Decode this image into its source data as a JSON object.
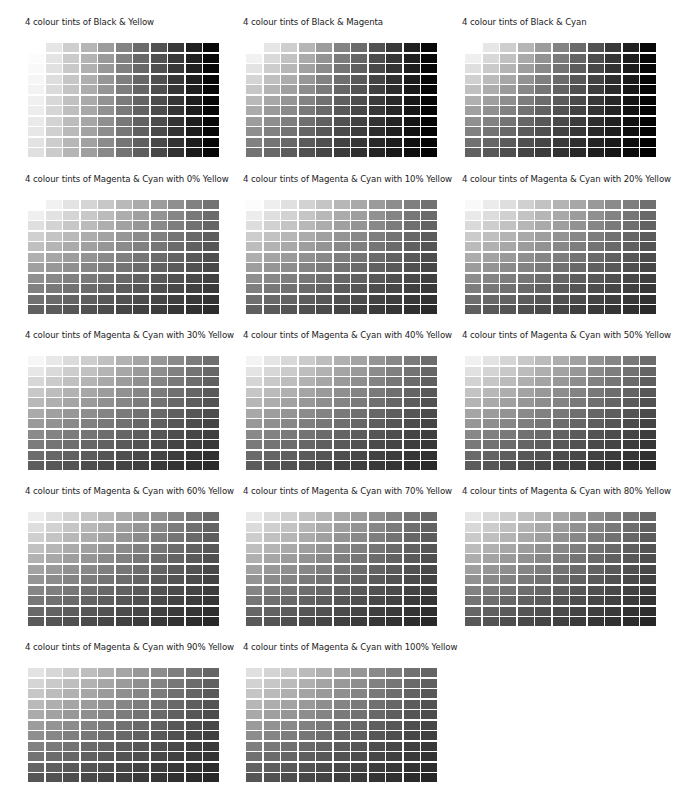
{
  "panels": [
    {
      "title": "4 colour tints of Black & Yellow",
      "x": 25,
      "y": 17,
      "col_ink": "Black",
      "row_ink": "Yellow",
      "row_factors": "y"
    },
    {
      "title": "4 colour tints of Black & Magenta",
      "x": 243,
      "y": 17,
      "col_ink": "Black",
      "row_ink": "Magenta",
      "row_factors": "m"
    },
    {
      "title": "4 colour tints of Black & Cyan",
      "x": 462,
      "y": 17,
      "col_ink": "Black",
      "row_ink": "Cyan",
      "row_factors": "c"
    },
    {
      "title": "4 colour tints of Magenta & Cyan with 0% Yellow",
      "x": 25,
      "y": 174,
      "col_ink": "Magenta",
      "row_ink": "Cyan",
      "yellow": 0
    },
    {
      "title": "4 colour tints of Magenta & Cyan with 10% Yellow",
      "x": 243,
      "y": 174,
      "col_ink": "Magenta",
      "row_ink": "Cyan",
      "yellow": 10
    },
    {
      "title": "4 colour tints of Magenta & Cyan with 20% Yellow",
      "x": 462,
      "y": 174,
      "col_ink": "Magenta",
      "row_ink": "Cyan",
      "yellow": 20
    },
    {
      "title": "4 colour tints of Magenta & Cyan with 30% Yellow",
      "x": 25,
      "y": 330,
      "col_ink": "Magenta",
      "row_ink": "Cyan",
      "yellow": 30
    },
    {
      "title": "4 colour tints of Magenta & Cyan with 40% Yellow",
      "x": 243,
      "y": 330,
      "col_ink": "Magenta",
      "row_ink": "Cyan",
      "yellow": 40
    },
    {
      "title": "4 colour tints of Magenta & Cyan with 50% Yellow",
      "x": 462,
      "y": 330,
      "col_ink": "Magenta",
      "row_ink": "Cyan",
      "yellow": 50
    },
    {
      "title": "4 colour tints of Magenta & Cyan with 60% Yellow",
      "x": 25,
      "y": 486,
      "col_ink": "Magenta",
      "row_ink": "Cyan",
      "yellow": 60
    },
    {
      "title": "4 colour tints of Magenta & Cyan with 70% Yellow",
      "x": 243,
      "y": 486,
      "col_ink": "Magenta",
      "row_ink": "Cyan",
      "yellow": 70
    },
    {
      "title": "4 colour tints of Magenta & Cyan with 80% Yellow",
      "x": 462,
      "y": 486,
      "col_ink": "Magenta",
      "row_ink": "Cyan",
      "yellow": 80
    },
    {
      "title": "4 colour tints of Magenta & Cyan with 90% Yellow",
      "x": 25,
      "y": 642,
      "col_ink": "Magenta",
      "row_ink": "Cyan",
      "yellow": 90
    },
    {
      "title": "4 colour tints of Magenta & Cyan with 100% Yellow",
      "x": 243,
      "y": 642,
      "col_ink": "Magenta",
      "row_ink": "Cyan",
      "yellow": 100
    }
  ],
  "chart_data": {
    "type": "heatmap",
    "grid": {
      "columns": 11,
      "rows": 11
    },
    "tint_steps_percent": [
      0,
      10,
      20,
      30,
      40,
      50,
      60,
      70,
      80,
      90,
      100
    ],
    "value_formula": "gray(0-255) = 255 * col_factor[col] * row_factor[row] * yellow_factor(panel)",
    "factors": {
      "k": [
        1.0,
        0.903,
        0.806,
        0.709,
        0.612,
        0.515,
        0.418,
        0.321,
        0.224,
        0.127,
        0.03
      ],
      "y": [
        1.0,
        0.988,
        0.976,
        0.964,
        0.952,
        0.94,
        0.928,
        0.916,
        0.904,
        0.892,
        0.88
      ],
      "m": [
        1.0,
        0.945,
        0.89,
        0.835,
        0.78,
        0.725,
        0.67,
        0.615,
        0.56,
        0.505,
        0.45
      ],
      "c": [
        1.0,
        0.938,
        0.876,
        0.814,
        0.752,
        0.69,
        0.628,
        0.566,
        0.504,
        0.442,
        0.38
      ]
    },
    "yellow_factor_per_10pct": 0.012
  }
}
